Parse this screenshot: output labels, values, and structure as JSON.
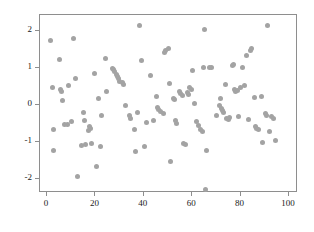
{
  "chart_data": {
    "type": "scatter",
    "title": "",
    "subtitle": "",
    "xlabel": "",
    "ylabel": "",
    "xlim": [
      -2,
      104
    ],
    "ylim": [
      -2.55,
      2.35
    ],
    "grid": false,
    "legend": null,
    "marker": {
      "shape": "circle",
      "color": "#a3a3a3",
      "size_px": 5
    },
    "axes": {
      "frame_color": "#8e8e8e",
      "x_ticks": [
        0,
        20,
        40,
        60,
        80,
        100
      ],
      "x_tick_labels": [
        "0",
        "20",
        "40",
        "60",
        "80",
        "100"
      ],
      "y_ticks": [
        2,
        1,
        0,
        -1,
        -2
      ],
      "y_tick_labels": [
        "2",
        "1",
        "0",
        "-1",
        "-2"
      ]
    },
    "series": [
      {
        "name": "series-1",
        "points": [
          [
            2.0,
            1.71
          ],
          [
            2.5,
            0.45
          ],
          [
            3.0,
            -0.68
          ],
          [
            3.2,
            -1.27
          ],
          [
            5.5,
            1.21
          ],
          [
            6.0,
            0.4
          ],
          [
            6.5,
            0.35
          ],
          [
            6.8,
            0.1
          ],
          [
            7.5,
            -0.55
          ],
          [
            9.0,
            -0.56
          ],
          [
            9.5,
            0.49
          ],
          [
            10.5,
            -0.47
          ],
          [
            11.5,
            1.78
          ],
          [
            12.0,
            0.7
          ],
          [
            13.0,
            -1.97
          ],
          [
            14.5,
            -1.13
          ],
          [
            15.5,
            -0.24
          ],
          [
            16.0,
            -0.45
          ],
          [
            16.5,
            -1.09
          ],
          [
            17.5,
            -0.72
          ],
          [
            17.8,
            -0.62
          ],
          [
            18.5,
            -0.65
          ],
          [
            19.0,
            -1.07
          ],
          [
            20.0,
            0.83
          ],
          [
            21.0,
            -1.69
          ],
          [
            21.5,
            0.14
          ],
          [
            22.5,
            -1.14
          ],
          [
            23.0,
            -0.32
          ],
          [
            24.5,
            1.22
          ],
          [
            25.0,
            0.33
          ],
          [
            27.5,
            0.97
          ],
          [
            28.0,
            0.93
          ],
          [
            28.5,
            0.87
          ],
          [
            29.0,
            0.8
          ],
          [
            29.5,
            0.73
          ],
          [
            30.0,
            0.68
          ],
          [
            30.5,
            0.62
          ],
          [
            31.5,
            0.57
          ],
          [
            32.0,
            0.52
          ],
          [
            33.0,
            -0.04
          ],
          [
            34.5,
            -0.32
          ],
          [
            35.0,
            -0.38
          ],
          [
            36.5,
            -0.7
          ],
          [
            37.0,
            -1.29
          ],
          [
            38.0,
            -0.22
          ],
          [
            38.5,
            2.12
          ],
          [
            39.5,
            1.17
          ],
          [
            40.5,
            -1.14
          ],
          [
            41.5,
            -0.49
          ],
          [
            43.0,
            0.76
          ],
          [
            44.5,
            -0.45
          ],
          [
            45.5,
            0.21
          ],
          [
            46.0,
            -0.1
          ],
          [
            46.5,
            -0.16
          ],
          [
            47.5,
            -0.2
          ],
          [
            48.5,
            -0.25
          ],
          [
            49.0,
            1.39
          ],
          [
            49.5,
            1.44
          ],
          [
            50.5,
            1.5
          ],
          [
            51.0,
            0.55
          ],
          [
            51.5,
            -1.56
          ],
          [
            52.5,
            0.16
          ],
          [
            53.0,
            0.11
          ],
          [
            53.5,
            -0.45
          ],
          [
            54.0,
            -0.52
          ],
          [
            55.0,
            0.34
          ],
          [
            55.5,
            0.29
          ],
          [
            56.5,
            0.23
          ],
          [
            57.0,
            -1.07
          ],
          [
            57.5,
            -1.1
          ],
          [
            58.5,
            0.31
          ],
          [
            59.0,
            0.26
          ],
          [
            59.5,
            0.45
          ],
          [
            60.0,
            0.4
          ],
          [
            60.5,
            0.9
          ],
          [
            61.5,
            0.02
          ],
          [
            62.0,
            -0.47
          ],
          [
            63.0,
            -0.57
          ],
          [
            64.0,
            -0.68
          ],
          [
            64.5,
            -0.73
          ],
          [
            65.0,
            0.99
          ],
          [
            65.5,
            2.01
          ],
          [
            66.0,
            -2.32
          ],
          [
            66.5,
            -1.25
          ],
          [
            67.5,
            0.98
          ],
          [
            68.5,
            1.0
          ],
          [
            70.5,
            -0.32
          ],
          [
            71.5,
            -0.05
          ],
          [
            72.0,
            0.16
          ],
          [
            72.5,
            -0.11
          ],
          [
            73.0,
            -0.17
          ],
          [
            73.5,
            -0.23
          ],
          [
            74.0,
            0.53
          ],
          [
            74.5,
            -0.38
          ],
          [
            75.5,
            -0.42
          ],
          [
            76.0,
            -0.36
          ],
          [
            77.0,
            1.05
          ],
          [
            77.5,
            1.08
          ],
          [
            78.0,
            0.4
          ],
          [
            78.5,
            0.33
          ],
          [
            79.0,
            0.36
          ],
          [
            79.5,
            -0.35
          ],
          [
            80.5,
            0.45
          ],
          [
            81.0,
            0.98
          ],
          [
            82.0,
            0.49
          ],
          [
            83.0,
            1.32
          ],
          [
            83.5,
            -0.43
          ],
          [
            84.5,
            1.44
          ],
          [
            85.0,
            1.5
          ],
          [
            86.0,
            0.17
          ],
          [
            86.5,
            -0.62
          ],
          [
            87.0,
            -0.66
          ],
          [
            88.0,
            -0.69
          ],
          [
            89.0,
            0.2
          ],
          [
            89.5,
            -1.04
          ],
          [
            90.5,
            -0.25
          ],
          [
            91.0,
            -0.3
          ],
          [
            91.5,
            2.12
          ],
          [
            92.5,
            -0.73
          ],
          [
            93.0,
            -0.35
          ],
          [
            94.0,
            -0.4
          ],
          [
            95.0,
            -0.98
          ]
        ]
      }
    ]
  }
}
